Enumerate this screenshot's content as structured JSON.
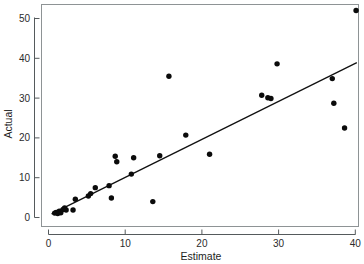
{
  "chart_data": {
    "type": "scatter",
    "title": "",
    "xlabel": "Estimate",
    "ylabel": "Actual",
    "xlim": [
      -1.5,
      42.0
    ],
    "ylim": [
      -2.0,
      53.5
    ],
    "xticks": [
      0,
      10,
      20,
      30,
      40
    ],
    "yticks": [
      0,
      10,
      20,
      30,
      40,
      50
    ],
    "xtick_labels": [
      "0",
      "10",
      "20",
      "30",
      "40"
    ],
    "ytick_labels": [
      "0",
      "10",
      "20",
      "30",
      "40",
      "50"
    ],
    "grid": false,
    "legend": false,
    "series": [
      {
        "name": "observations",
        "marker": "filled-circle",
        "color": "#0b0b0b",
        "points": [
          [
            0.8,
            1.1
          ],
          [
            1.0,
            1.3
          ],
          [
            1.2,
            1.0
          ],
          [
            1.4,
            1.6
          ],
          [
            1.6,
            1.2
          ],
          [
            1.9,
            2.0
          ],
          [
            2.1,
            2.4
          ],
          [
            2.3,
            1.9
          ],
          [
            3.2,
            1.9
          ],
          [
            3.5,
            4.6
          ],
          [
            5.2,
            5.4
          ],
          [
            5.5,
            6.0
          ],
          [
            6.1,
            7.5
          ],
          [
            7.9,
            8.0
          ],
          [
            8.2,
            4.9
          ],
          [
            8.7,
            15.4
          ],
          [
            8.9,
            14.0
          ],
          [
            10.8,
            10.9
          ],
          [
            11.1,
            15.0
          ],
          [
            13.6,
            4.0
          ],
          [
            14.5,
            15.5
          ],
          [
            15.7,
            35.5
          ],
          [
            17.9,
            20.7
          ],
          [
            21.0,
            15.9
          ],
          [
            27.8,
            30.7
          ],
          [
            28.6,
            30.1
          ],
          [
            29.0,
            29.9
          ],
          [
            29.8,
            38.6
          ],
          [
            37.0,
            34.9
          ],
          [
            37.2,
            28.7
          ],
          [
            38.6,
            22.5
          ],
          [
            40.1,
            52.0
          ]
        ]
      }
    ],
    "fit_line": {
      "name": "regression-line",
      "color": "#111111",
      "x_start": 0.4,
      "y_start": 0.9,
      "x_end": 40.2,
      "y_end": 38.9
    }
  }
}
